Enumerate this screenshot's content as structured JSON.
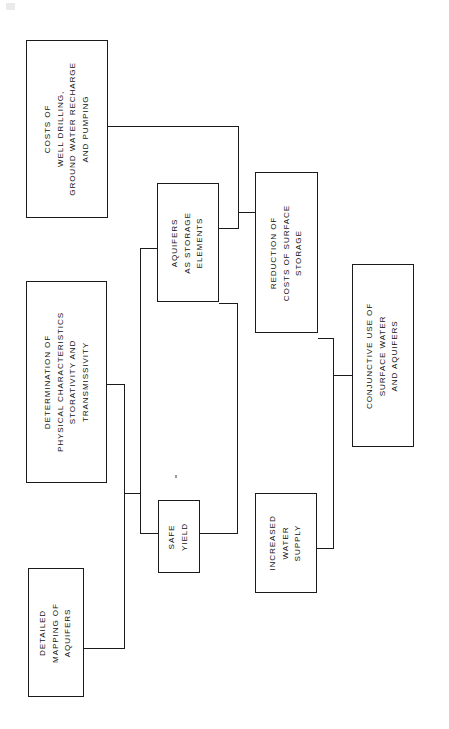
{
  "diagram": {
    "orientation": "rotated-90-counterclockwise",
    "line_color": "#1b1b1b",
    "background_color": "#ffffff",
    "nodes": [
      {
        "id": "costs-well-drilling",
        "lines": [
          "COSTS OF",
          "WELL DRILLING,",
          "GROUND WATER RECHARGE",
          "AND PUMPING"
        ],
        "x": 26,
        "y": 40,
        "w": 82,
        "h": 178
      },
      {
        "id": "determination-physical-characteristics",
        "lines": [
          "DETERMINATION OF",
          "PHYSICAL CHARACTERISTICS",
          "STORATIVITY AND",
          "TRANSMISSIVITY"
        ],
        "x": 26,
        "y": 281,
        "w": 81,
        "h": 202
      },
      {
        "id": "detailed-mapping-of-aquifers",
        "lines": [
          "DETAILED",
          "MAPPING OF",
          "AQUIFERS"
        ],
        "x": 28,
        "y": 568,
        "w": 56,
        "h": 129
      },
      {
        "id": "aquifers-as-storage-elements",
        "lines": [
          "AQUIFERS",
          "AS STORAGE",
          "ELEMENTS"
        ],
        "x": 157,
        "y": 183,
        "w": 62,
        "h": 119
      },
      {
        "id": "safe-yield",
        "lines": [
          "SAFE",
          "YIELD"
        ],
        "x": 158,
        "y": 500,
        "w": 42,
        "h": 73
      },
      {
        "id": "reduction-of-costs-of-surface-storage",
        "lines": [
          "REDUCTION OF",
          "COSTS OF SURFACE",
          "STORAGE"
        ],
        "x": 255,
        "y": 172,
        "w": 63,
        "h": 161
      },
      {
        "id": "increased-water-supply",
        "lines": [
          "INCREASED",
          "WATER",
          "SUPPLY"
        ],
        "x": 255,
        "y": 493,
        "w": 62,
        "h": 100
      },
      {
        "id": "conjunctive-use-of-surface-water-and-aquifers",
        "lines": [
          "CONJUNCTIVE USE OF",
          "SURFACE WATER",
          "AND AQUIFERS"
        ],
        "x": 352,
        "y": 264,
        "w": 62,
        "h": 183
      }
    ],
    "edges": [
      {
        "id": "costs-to-trunk-a",
        "type": "h",
        "x": 108,
        "y": 126,
        "len": 131
      },
      {
        "id": "trunk-a-vertical",
        "type": "v",
        "x": 238,
        "y": 126,
        "len": 103
      },
      {
        "id": "trunk-a-to-reduction",
        "type": "h",
        "x": 238,
        "y": 212,
        "len": 18
      },
      {
        "id": "trunk-a-to-aquifers",
        "type": "h",
        "x": 219,
        "y": 228,
        "len": 20
      },
      {
        "id": "aquifers-left-stub",
        "type": "h",
        "x": 140,
        "y": 248,
        "len": 18
      },
      {
        "id": "trunk-b-vertical",
        "type": "v",
        "x": 140,
        "y": 248,
        "len": 285
      },
      {
        "id": "trunk-b-to-safe-yield",
        "type": "h",
        "x": 140,
        "y": 533,
        "len": 19
      },
      {
        "id": "determination-stub",
        "type": "h",
        "x": 107,
        "y": 384,
        "len": 18
      },
      {
        "id": "trunk-c-vertical",
        "type": "v",
        "x": 124,
        "y": 384,
        "len": 265
      },
      {
        "id": "trunk-c-to-mapping",
        "type": "h",
        "x": 84,
        "y": 648,
        "len": 41
      },
      {
        "id": "trunk-c-mid-tick",
        "type": "h",
        "x": 124,
        "y": 493,
        "len": 17
      },
      {
        "id": "aquifers-right-stub",
        "type": "h",
        "x": 219,
        "y": 303,
        "len": 19
      },
      {
        "id": "trunk-d-vertical",
        "type": "v",
        "x": 237,
        "y": 303,
        "len": 231
      },
      {
        "id": "trunk-d-to-safe-yield",
        "type": "h",
        "x": 200,
        "y": 533,
        "len": 38
      },
      {
        "id": "reduction-right-stub",
        "type": "h",
        "x": 318,
        "y": 338,
        "len": 16
      },
      {
        "id": "trunk-e-vertical",
        "type": "v",
        "x": 333,
        "y": 338,
        "len": 211
      },
      {
        "id": "trunk-e-to-conjunctive",
        "type": "h",
        "x": 333,
        "y": 375,
        "len": 20
      },
      {
        "id": "trunk-e-to-increased",
        "type": "h",
        "x": 317,
        "y": 548,
        "len": 17
      }
    ],
    "marks": [
      {
        "id": "scan-speck-top-left",
        "x": 6,
        "y": 3
      },
      {
        "id": "stray-dot-center",
        "x": 175,
        "y": 475
      }
    ]
  }
}
